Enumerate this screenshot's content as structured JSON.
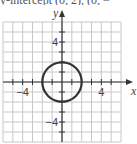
{
  "header": {
    "cut_off_text": "y-intercept (0, 2), (0, −"
  },
  "chart_data": {
    "type": "line",
    "title": "",
    "xlabel": "x",
    "ylabel": "y",
    "xlim": [
      -6,
      6
    ],
    "ylim": [
      -6,
      6
    ],
    "grid": true,
    "grid_step": 1,
    "x_tick_labels": [
      {
        "value": -4,
        "label": "−4"
      },
      {
        "value": 4,
        "label": "4"
      }
    ],
    "y_tick_labels": [
      {
        "value": 4,
        "label": "4"
      },
      {
        "value": -4,
        "label": "−4"
      }
    ],
    "series": [
      {
        "name": "circle",
        "shape": "circle",
        "center": [
          0,
          0
        ],
        "radius": 2
      }
    ],
    "colors": {
      "grid": "#c8c8c8",
      "axis": "#333333",
      "curve": "#333333"
    }
  }
}
